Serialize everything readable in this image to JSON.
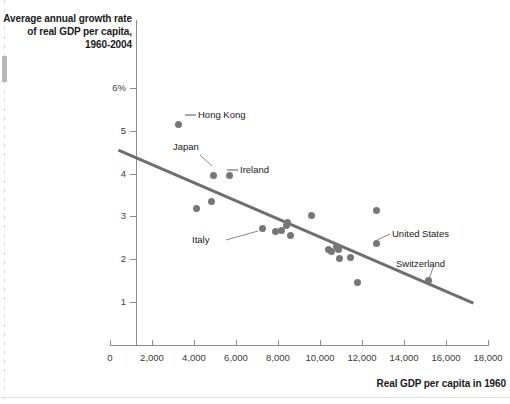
{
  "chart_data": {
    "type": "scatter",
    "title": "",
    "ylabel": "Average annual growth rate of real GDP per capita, 1960-2004",
    "xlabel": "Real GDP per capita in 1960",
    "xlim": [
      0,
      18000
    ],
    "ylim": [
      0,
      6
    ],
    "xticks": [
      0,
      2000,
      4000,
      6000,
      8000,
      10000,
      12000,
      14000,
      16000,
      18000
    ],
    "xtick_labels": [
      "0",
      "2,000",
      "4,000",
      "6,000",
      "8,000",
      "10,000",
      "12,000",
      "14,000",
      "16,000",
      "18,000"
    ],
    "yticks": [
      1,
      2,
      3,
      4,
      5,
      6
    ],
    "ytick_labels": [
      "1",
      "2",
      "3",
      "4",
      "5",
      "6%"
    ],
    "grid": false,
    "legend": "none",
    "marker_color": "#767676",
    "trendline_color": "#6e6e6e",
    "points": [
      {
        "label": "Hong Kong",
        "x": 3250,
        "y": 5.15
      },
      {
        "label": "Japan",
        "x": 4950,
        "y": 3.95
      },
      {
        "label": "Ireland",
        "x": 5700,
        "y": 3.95
      },
      {
        "label": "",
        "x": 4850,
        "y": 3.35
      },
      {
        "label": "",
        "x": 4100,
        "y": 3.18
      },
      {
        "label": "Italy",
        "x": 7250,
        "y": 2.72
      },
      {
        "label": "",
        "x": 7900,
        "y": 2.65
      },
      {
        "label": "",
        "x": 8150,
        "y": 2.68
      },
      {
        "label": "",
        "x": 8400,
        "y": 2.78
      },
      {
        "label": "",
        "x": 8450,
        "y": 2.85
      },
      {
        "label": "",
        "x": 8600,
        "y": 2.55
      },
      {
        "label": "",
        "x": 9600,
        "y": 3.02
      },
      {
        "label": "",
        "x": 10400,
        "y": 2.22
      },
      {
        "label": "",
        "x": 10550,
        "y": 2.18
      },
      {
        "label": "",
        "x": 10800,
        "y": 2.3
      },
      {
        "label": "",
        "x": 10900,
        "y": 2.22
      },
      {
        "label": "",
        "x": 10950,
        "y": 2.02
      },
      {
        "label": "",
        "x": 11450,
        "y": 2.05
      },
      {
        "label": "",
        "x": 11800,
        "y": 1.45
      },
      {
        "label": "",
        "x": 12700,
        "y": 3.15
      },
      {
        "label": "United States",
        "x": 12700,
        "y": 2.38
      },
      {
        "label": "Switzerland",
        "x": 15150,
        "y": 1.5
      }
    ],
    "trendline": {
      "x1": 400,
      "y1": 4.55,
      "x2": 17300,
      "y2": 0.98
    }
  },
  "labels": {
    "hong_kong": "Hong Kong",
    "japan": "Japan",
    "ireland": "Ireland",
    "italy": "Italy",
    "united_states": "United States",
    "switzerland": "Switzerland"
  },
  "axis": {
    "y_title": "Average annual growth rate of real GDP per capita, 1960-2004",
    "x_title": "Real GDP per capita in 1960",
    "x0": "0",
    "x1": "2,000",
    "x2": "4,000",
    "x3": "6,000",
    "x4": "8,000",
    "x5": "10,000",
    "x6": "12,000",
    "x7": "14,000",
    "x8": "16,000",
    "x9": "18,000",
    "y1": "1",
    "y2": "2",
    "y3": "3",
    "y4": "4",
    "y5": "5",
    "y6": "6%"
  }
}
